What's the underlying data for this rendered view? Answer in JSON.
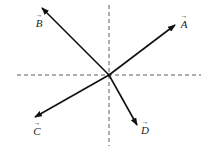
{
  "diagram": {
    "origin": {
      "x": 109,
      "y": 75
    },
    "axes": {
      "vertical": {
        "x": 109,
        "y1": 5,
        "y2": 146,
        "style": "dashed"
      },
      "horizontal": {
        "y": 75,
        "x1": 17,
        "x2": 201,
        "style": "dashed"
      }
    },
    "vectors": [
      {
        "name": "A",
        "label": "A",
        "arrow": "→",
        "tip": {
          "x": 175,
          "y": 25
        },
        "label_pos": {
          "x": 178,
          "y": 14
        }
      },
      {
        "name": "B",
        "label": "B",
        "arrow": "→",
        "tip": {
          "x": 42,
          "y": 8
        },
        "label_pos": {
          "x": 33,
          "y": 13
        }
      },
      {
        "name": "C",
        "label": "C",
        "arrow": "→",
        "tip": {
          "x": 35,
          "y": 117
        },
        "label_pos": {
          "x": 31,
          "y": 121
        }
      },
      {
        "name": "D",
        "label": "D",
        "arrow": "→",
        "tip": {
          "x": 137,
          "y": 125
        },
        "label_pos": {
          "x": 139,
          "y": 120
        }
      }
    ],
    "colors": {
      "vector": "#111111",
      "axis": "#333333",
      "background": "#ffffff"
    }
  }
}
